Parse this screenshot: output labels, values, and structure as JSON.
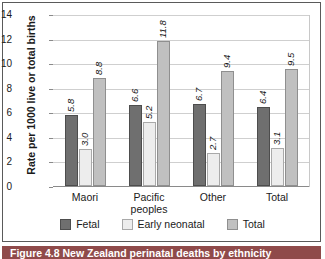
{
  "figure": {
    "caption": "Figure 4.8 New Zealand perinatal deaths by ethnicity",
    "caption_band_color": "#8f4a4a"
  },
  "chart_data": {
    "type": "bar",
    "title": "",
    "xlabel": "",
    "ylabel": "Rate per 1000 live or total births",
    "ylim": [
      0,
      14
    ],
    "yticks": [
      "0",
      "2",
      "4",
      "6",
      "8",
      "10",
      "12",
      "14"
    ],
    "grid": true,
    "legend_position": "bottom",
    "categories": [
      "Maori",
      "Pacific peoples",
      "Other",
      "Total"
    ],
    "category_lines": [
      [
        "Maori"
      ],
      [
        "Pacific",
        "peoples"
      ],
      [
        "Other"
      ],
      [
        "Total"
      ]
    ],
    "series": [
      {
        "name": "Fetal",
        "color": "#6f6f6f",
        "values": [
          5.8,
          6.6,
          6.7,
          6.4
        ],
        "labels": [
          "5.8",
          "6.6",
          "6.7",
          "6.4"
        ]
      },
      {
        "name": "Early neonatal",
        "color": "#ededed",
        "values": [
          3.0,
          5.2,
          2.7,
          3.1
        ],
        "labels": [
          "3.0",
          "5.2",
          "2.7",
          "3.1"
        ]
      },
      {
        "name": "Total",
        "color": "#c0c0c0",
        "values": [
          8.8,
          11.8,
          9.4,
          9.5
        ],
        "labels": [
          "8.8",
          "11.8",
          "9.4",
          "9.5"
        ]
      }
    ]
  }
}
